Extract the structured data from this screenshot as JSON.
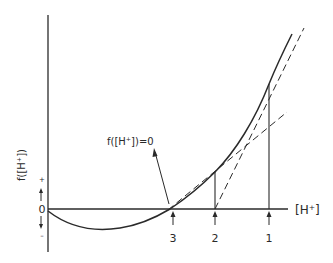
{
  "diagram": {
    "y_axis": {
      "label": "f([H⁺])",
      "zero_label": "0",
      "positive_sign": "+",
      "negative_sign": "–"
    },
    "x_axis": {
      "label": "[H⁺]"
    },
    "root_annotation": "f([H⁺])=0",
    "iteration_markers": [
      {
        "label": "3"
      },
      {
        "label": "2"
      },
      {
        "label": "1"
      }
    ],
    "colors": {
      "ink": "#2a2a2a",
      "background": "#ffffff"
    }
  }
}
